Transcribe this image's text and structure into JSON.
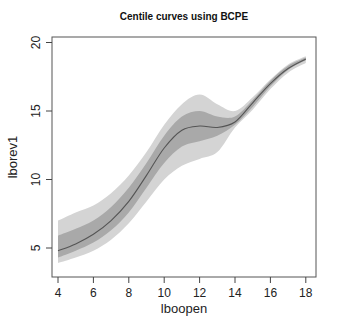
{
  "chart_data": {
    "type": "area",
    "title": "Centile curves using BCPE",
    "xlabel": "lboopen",
    "ylabel": "lborev1",
    "xlim": [
      3.6,
      18.6
    ],
    "ylim": [
      3.0,
      20.4
    ],
    "x_ticks": [
      "4",
      "6",
      "8",
      "10",
      "12",
      "14",
      "16",
      "18"
    ],
    "y_ticks": [
      "5",
      "10",
      "15",
      "20"
    ],
    "grid": false,
    "legend": null,
    "x": [
      4,
      5,
      6,
      7,
      8,
      9,
      10,
      11,
      12,
      13,
      14,
      15,
      16,
      17,
      18
    ],
    "series": [
      {
        "name": "outer band upper",
        "values": [
          7.0,
          7.6,
          8.1,
          9.0,
          10.3,
          12.0,
          14.0,
          15.5,
          16.2,
          15.5,
          15.0,
          16.0,
          17.3,
          18.4,
          19.0
        ]
      },
      {
        "name": "inner band upper",
        "values": [
          5.9,
          6.4,
          7.0,
          8.0,
          9.4,
          11.2,
          13.2,
          14.6,
          15.0,
          14.6,
          14.6,
          15.8,
          17.2,
          18.3,
          18.9
        ]
      },
      {
        "name": "median",
        "values": [
          4.8,
          5.3,
          6.0,
          7.0,
          8.4,
          10.3,
          12.3,
          13.6,
          13.9,
          13.8,
          14.2,
          15.6,
          17.0,
          18.1,
          18.8
        ]
      },
      {
        "name": "inner band lower",
        "values": [
          4.3,
          4.8,
          5.4,
          6.3,
          7.6,
          9.4,
          11.2,
          12.4,
          12.8,
          13.2,
          14.0,
          15.3,
          16.8,
          18.0,
          18.7
        ]
      },
      {
        "name": "outer band lower",
        "values": [
          3.9,
          4.3,
          4.8,
          5.6,
          6.8,
          8.4,
          10.0,
          11.0,
          11.5,
          12.0,
          13.8,
          15.1,
          16.6,
          17.8,
          18.5
        ]
      }
    ],
    "colors": {
      "outer": "#d4d4d4",
      "inner": "#a9a9a9",
      "median": "#555555"
    }
  }
}
